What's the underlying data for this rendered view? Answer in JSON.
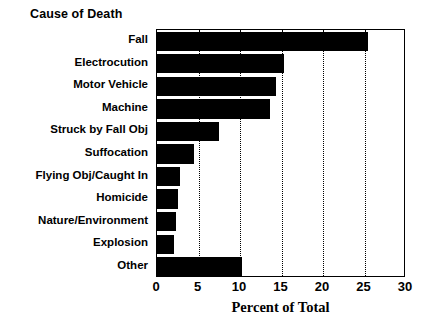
{
  "chart_data": {
    "type": "bar",
    "orientation": "horizontal",
    "title": "Cause of Death",
    "xlabel": "Percent of Total",
    "ylabel": "",
    "xlim": [
      0,
      30
    ],
    "xticks": [
      0,
      5,
      10,
      15,
      20,
      25,
      30
    ],
    "xtick_labels": [
      "0",
      "5",
      "10",
      "15",
      "20",
      "25",
      "30"
    ],
    "grid": "vertical-dotted",
    "legend": "none",
    "bar_color": "#000000",
    "categories": [
      "Fall",
      "Electrocution",
      "Motor Vehicle",
      "Machine",
      "Struck by Fall Obj",
      "Suffocation",
      "Flying Obj/Caught In",
      "Homicide",
      "Nature/Environment",
      "Explosion",
      "Other"
    ],
    "values": [
      25.4,
      15.3,
      14.3,
      13.6,
      7.5,
      4.4,
      2.8,
      2.5,
      2.3,
      2.1,
      10.3
    ]
  }
}
